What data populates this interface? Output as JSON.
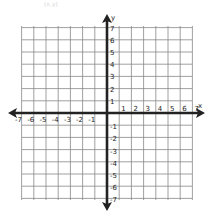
{
  "header": {
    "faint_caption": "(x,y)"
  },
  "plane": {
    "x_axis_label": "x",
    "y_axis_label": "y",
    "x_min": -7,
    "x_max": 7,
    "y_min": -7,
    "y_max": 7,
    "grid_color": "#888888",
    "axis_color": "#222222",
    "x_tick_labels": [
      "-7",
      "-6",
      "-5",
      "-4",
      "-3",
      "-2",
      "-1",
      "1",
      "2",
      "3",
      "4",
      "5",
      "6",
      "7"
    ],
    "y_tick_labels": [
      "7",
      "6",
      "5",
      "4",
      "3",
      "2",
      "1",
      "-1",
      "-2",
      "-3",
      "-4",
      "-5",
      "-6",
      "-7"
    ]
  },
  "chart_data": {
    "type": "coordinate-plane",
    "title": "",
    "xlabel": "x",
    "ylabel": "y",
    "xlim": [
      -7,
      7
    ],
    "ylim": [
      -7,
      7
    ],
    "grid": true,
    "x_ticks": [
      -7,
      -6,
      -5,
      -4,
      -3,
      -2,
      -1,
      1,
      2,
      3,
      4,
      5,
      6,
      7
    ],
    "y_ticks": [
      7,
      6,
      5,
      4,
      3,
      2,
      1,
      -1,
      -2,
      -3,
      -4,
      -5,
      -6,
      -7
    ],
    "series": []
  }
}
